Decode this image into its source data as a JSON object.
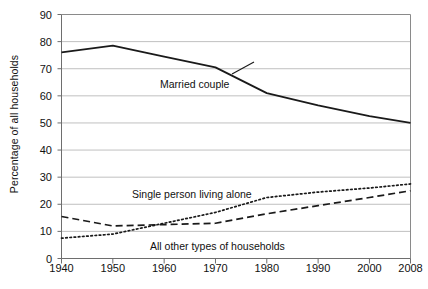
{
  "chart_data": {
    "type": "line",
    "title": "",
    "xlabel": "",
    "ylabel": "Percentage of all households",
    "xlim": [
      1940,
      2008
    ],
    "ylim": [
      0,
      90
    ],
    "ytick_step": 10,
    "grid": true,
    "legend": "inline-annotations",
    "x": [
      1940,
      1950,
      1960,
      1970,
      1980,
      1990,
      2000,
      2008
    ],
    "xtick_labels": [
      "1940",
      "1950",
      "1960",
      "1970",
      "1980",
      "1990",
      "2000",
      "2008"
    ],
    "ytick_labels": [
      "0",
      "10",
      "20",
      "30",
      "40",
      "50",
      "60",
      "70",
      "80",
      "90"
    ],
    "series": [
      {
        "name": "Married couple",
        "style": "solid",
        "color": "#1a1a1a",
        "values": [
          76.0,
          78.5,
          74.5,
          70.5,
          61.0,
          56.5,
          52.5,
          50.0
        ]
      },
      {
        "name": "Single person living alone",
        "style": "dotted",
        "color": "#1a1a1a",
        "values": [
          7.5,
          9.0,
          13.0,
          17.0,
          22.5,
          24.5,
          26.0,
          27.5
        ]
      },
      {
        "name": "All other types of households",
        "style": "dashed",
        "color": "#1a1a1a",
        "values": [
          15.5,
          12.0,
          12.5,
          13.0,
          16.5,
          19.5,
          22.5,
          25.0
        ]
      }
    ],
    "annotations": [
      {
        "text": "Married couple",
        "x_px": 160,
        "y_px": 78
      },
      {
        "text": "Single person living alone",
        "x_px": 132,
        "y_px": 188
      },
      {
        "text": "All other types of households",
        "x_px": 150,
        "y_px": 240
      }
    ]
  },
  "axis": {
    "y_title": "Percentage of all households"
  }
}
